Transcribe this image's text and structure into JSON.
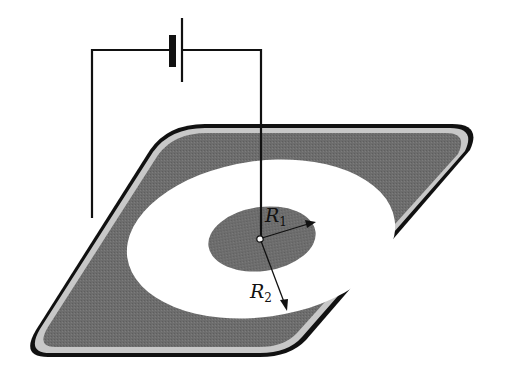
{
  "diagram": {
    "type": "physics-schematic",
    "labels": {
      "r1_main": "R",
      "r1_sub": "1",
      "r2_main": "R",
      "r2_sub": "2"
    },
    "components": {
      "battery": "battery-symbol",
      "plate": "rounded-parallelogram-plate",
      "outer_region": "shaded-conductor",
      "gap_region": "white-annulus",
      "inner_region": "shaded-inner-disk",
      "center_contact": "point-electrode"
    },
    "colors": {
      "plate_fill": "#6e6e6e",
      "plate_rim": "#c8c8c8",
      "outline": "#111111",
      "gap": "#ffffff",
      "wire": "#111111"
    }
  }
}
